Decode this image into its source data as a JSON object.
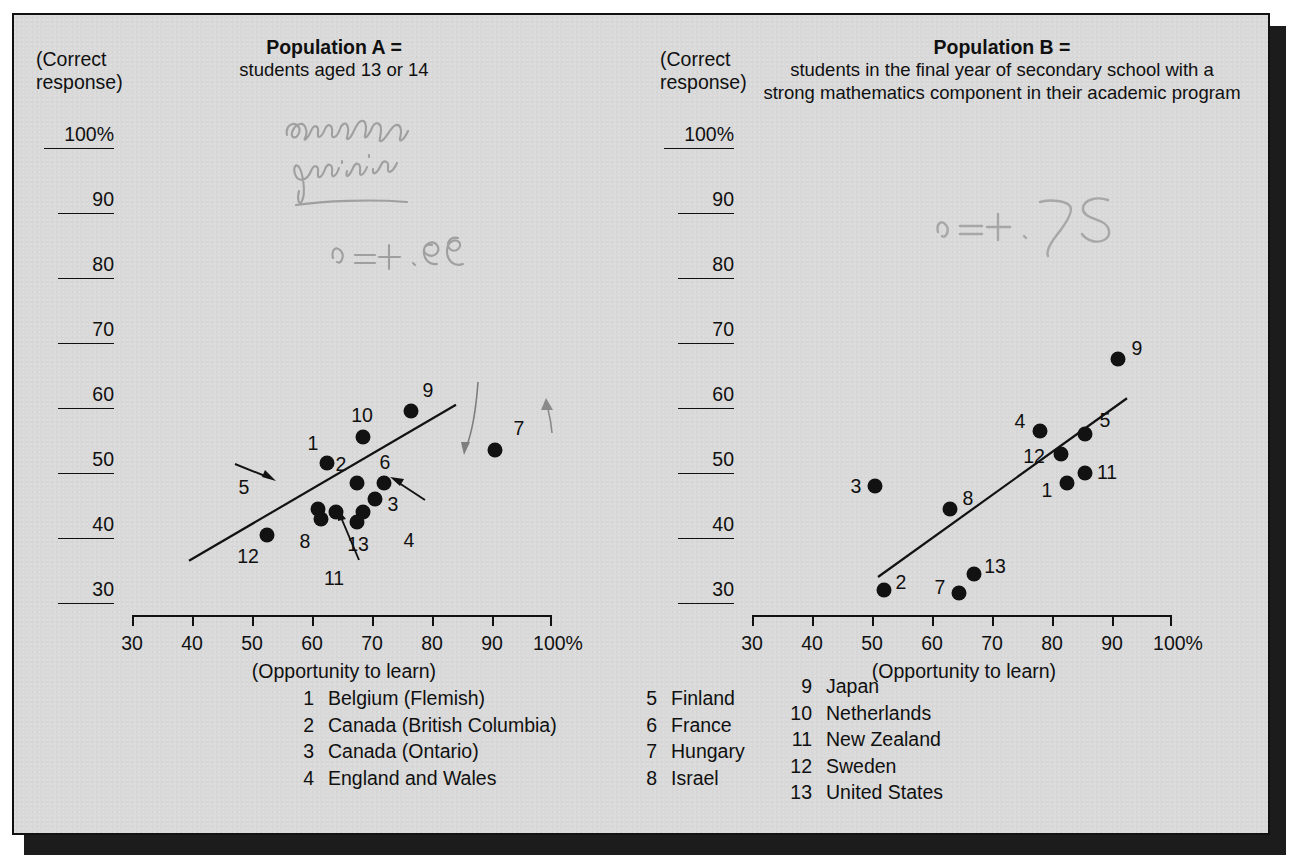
{
  "figure": {
    "background_color": "#d9d9d9",
    "border_color": "#111111",
    "dot_color": "#121212"
  },
  "panelA": {
    "y_axis_caption": "(Correct\nresponse)",
    "title_bold": "Population A =",
    "title_sub": "students aged 13 or 14",
    "x_caption": "(Opportunity to learn)",
    "handwriting": {
      "note_line1": "correlation",
      "note_line2": "positive",
      "r_value": "r = +.85"
    }
  },
  "panelB": {
    "y_axis_caption": "(Correct\nresponse)",
    "title_bold": "Population B =",
    "title_sub": "students in the final year of secondary school\nwith a strong mathematics component in their\nacademic program",
    "x_caption": "(Opportunity to learn)",
    "handwriting": {
      "r_value": "r = +.75"
    }
  },
  "y_ticks": [
    "100%",
    "90",
    "80",
    "70",
    "60",
    "50",
    "40",
    "30"
  ],
  "x_ticks": [
    "30",
    "40",
    "50",
    "60",
    "70",
    "80",
    "90",
    "100%"
  ],
  "legend": {
    "col1": [
      {
        "num": "1",
        "name": "Belgium (Flemish)"
      },
      {
        "num": "2",
        "name": "Canada (British Columbia)"
      },
      {
        "num": "3",
        "name": "Canada (Ontario)"
      },
      {
        "num": "4",
        "name": "England and Wales"
      }
    ],
    "col2": [
      {
        "num": "5",
        "name": "Finland"
      },
      {
        "num": "6",
        "name": "France"
      },
      {
        "num": "7",
        "name": "Hungary"
      },
      {
        "num": "8",
        "name": "Israel"
      }
    ],
    "col3": [
      {
        "num": "9",
        "name": "Japan"
      },
      {
        "num": "10",
        "name": "Netherlands"
      },
      {
        "num": "11",
        "name": "New Zealand"
      },
      {
        "num": "12",
        "name": "Sweden"
      },
      {
        "num": "13",
        "name": "United States"
      }
    ]
  },
  "chart_data": [
    {
      "type": "scatter",
      "title": "Population A = students aged 13 or 14",
      "xlabel": "(Opportunity to learn)",
      "ylabel": "(Correct response)",
      "xlim": [
        30,
        100
      ],
      "ylim": [
        30,
        100
      ],
      "xticks": [
        30,
        40,
        50,
        60,
        70,
        80,
        90,
        100
      ],
      "yticks": [
        30,
        40,
        50,
        60,
        70,
        80,
        90,
        100
      ],
      "grid": false,
      "legend": "below",
      "annotation": "r = +.85",
      "trendline": {
        "x0": 39.5,
        "y0": 36.5,
        "x1": 84.0,
        "y1": 60.5
      },
      "points": [
        {
          "label": "1",
          "country": "Belgium (Flemish)",
          "x": 62.5,
          "y": 51.5,
          "label_dx": -14,
          "label_dy": -20
        },
        {
          "label": "2",
          "country": "Canada (British Columbia)",
          "x": 67.5,
          "y": 48.5,
          "label_dx": -16,
          "label_dy": -19
        },
        {
          "label": "3",
          "country": "Canada (Ontario)",
          "x": 70.5,
          "y": 46.0,
          "label_dx": 18,
          "label_dy": 5
        },
        {
          "label": "4",
          "country": "England and Wales",
          "x": 68.5,
          "y": 44.0,
          "label_dx": 46,
          "label_dy": 28
        },
        {
          "label": "5",
          "country": "Finland",
          "x": 61.0,
          "y": 44.5,
          "label_dx": -74,
          "label_dy": -22
        },
        {
          "label": "6",
          "country": "France",
          "x": 72.0,
          "y": 48.5,
          "label_dx": 1,
          "label_dy": -21
        },
        {
          "label": "7",
          "country": "Hungary",
          "x": 90.5,
          "y": 53.5,
          "label_dx": 24,
          "label_dy": -22
        },
        {
          "label": "8",
          "country": "Israel",
          "x": 61.5,
          "y": 43.0,
          "label_dx": -16,
          "label_dy": 22
        },
        {
          "label": "9",
          "country": "Japan",
          "x": 76.5,
          "y": 59.5,
          "label_dx": 17,
          "label_dy": -21
        },
        {
          "label": "10",
          "country": "Netherlands",
          "x": 68.5,
          "y": 55.5,
          "label_dx": -1,
          "label_dy": -22
        },
        {
          "label": "11",
          "country": "New Zealand",
          "x": 64.0,
          "y": 44.0,
          "label_dx": -2,
          "label_dy": 66
        },
        {
          "label": "12",
          "country": "Sweden",
          "x": 52.5,
          "y": 40.5,
          "label_dx": -19,
          "label_dy": 21
        },
        {
          "label": "13",
          "country": "United States",
          "x": 67.5,
          "y": 42.5,
          "label_dx": 1,
          "label_dy": 22
        }
      ]
    },
    {
      "type": "scatter",
      "title": "Population B = students in the final year of secondary school with a strong mathematics component in their academic program",
      "xlabel": "(Opportunity to learn)",
      "ylabel": "(Correct response)",
      "xlim": [
        30,
        100
      ],
      "ylim": [
        30,
        100
      ],
      "xticks": [
        30,
        40,
        50,
        60,
        70,
        80,
        90,
        100
      ],
      "yticks": [
        30,
        40,
        50,
        60,
        70,
        80,
        90,
        100
      ],
      "grid": false,
      "legend": "below",
      "annotation": "r = +.75",
      "trendline": {
        "x0": 51.0,
        "y0": 34.0,
        "x1": 92.5,
        "y1": 61.5
      },
      "points": [
        {
          "label": "1",
          "country": "Belgium (Flemish)",
          "x": 82.5,
          "y": 48.5,
          "label_dx": -20,
          "label_dy": 7
        },
        {
          "label": "2",
          "country": "Canada (British Columbia)",
          "x": 52.0,
          "y": 32.0,
          "label_dx": 17,
          "label_dy": -8
        },
        {
          "label": "3",
          "country": "Canada (Ontario)",
          "x": 50.5,
          "y": 48.0,
          "label_dx": -19,
          "label_dy": 0
        },
        {
          "label": "4",
          "country": "England and Wales",
          "x": 78.0,
          "y": 56.5,
          "label_dx": -20,
          "label_dy": -10
        },
        {
          "label": "5",
          "country": "Finland",
          "x": 85.5,
          "y": 56.0,
          "label_dx": 20,
          "label_dy": -14
        },
        {
          "label": "7",
          "country": "Hungary",
          "x": 64.5,
          "y": 31.5,
          "label_dx": -19,
          "label_dy": -6
        },
        {
          "label": "8",
          "country": "Israel",
          "x": 63.0,
          "y": 44.5,
          "label_dx": 18,
          "label_dy": -11
        },
        {
          "label": "9",
          "country": "Japan",
          "x": 91.0,
          "y": 67.5,
          "label_dx": 19,
          "label_dy": -11
        },
        {
          "label": "11",
          "country": "New Zealand",
          "x": 85.5,
          "y": 50.0,
          "label_dx": 22,
          "label_dy": -1
        },
        {
          "label": "12",
          "country": "Sweden",
          "x": 81.5,
          "y": 53.0,
          "label_dx": -27,
          "label_dy": 2
        },
        {
          "label": "13",
          "country": "United States",
          "x": 67.0,
          "y": 34.5,
          "label_dx": 21,
          "label_dy": -8
        }
      ]
    }
  ]
}
